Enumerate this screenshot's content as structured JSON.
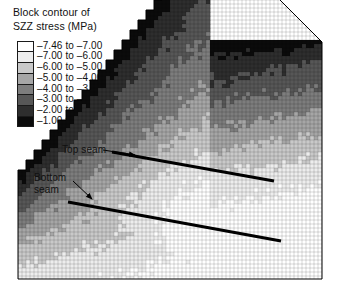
{
  "title": {
    "line1": "Block contour of",
    "line2": "SZZ stress (MPa)"
  },
  "legend": {
    "entries": [
      {
        "label": "–7.46 to –7.00",
        "color": "#ffffff",
        "low": -7.46,
        "high": -7.0
      },
      {
        "label": "–7.00 to –6.00",
        "color": "#ededed",
        "low": -7.0,
        "high": -6.0
      },
      {
        "label": "–6.00 to –5.00",
        "color": "#c9c9c9",
        "low": -6.0,
        "high": -5.0
      },
      {
        "label": "–5.00 to –4.00",
        "color": "#a6a6a6",
        "low": -5.0,
        "high": -4.0
      },
      {
        "label": "–4.00 to –3.00",
        "color": "#7d7d7d",
        "low": -4.0,
        "high": -3.0
      },
      {
        "label": "–3.00 to –2.00",
        "color": "#575757",
        "low": -3.0,
        "high": -2.0
      },
      {
        "label": "–2.00 to –1.00",
        "color": "#2e2e2e",
        "low": -2.0,
        "high": -1.0
      },
      {
        "label": "–1.00 to –0.04",
        "color": "#0b0b0b",
        "low": -1.0,
        "high": -0.04
      }
    ]
  },
  "annotations": [
    {
      "name": "top-seam",
      "text": "Top seam"
    },
    {
      "name": "bottom-seam-line1",
      "text": "Bottom"
    },
    {
      "name": "bottom-seam-line2",
      "text": "seam"
    }
  ],
  "chart_data": {
    "type": "heatmap",
    "title": "Block contour of SZZ stress (MPa)",
    "xlabel": "",
    "ylabel": "",
    "units": "MPa",
    "value_range": [
      -7.46,
      -0.04
    ],
    "grid": true,
    "legend_position": "top-left",
    "colormap": "greyscale-inverted",
    "bands": [
      -7.46,
      -7.0,
      -6.0,
      -5.0,
      -4.0,
      -3.0,
      -2.0,
      -1.0,
      -0.04
    ],
    "mesh": {
      "left": 18,
      "right": 322,
      "bottom": 279,
      "top_flat_y": 42,
      "top_flat_start_x": 210,
      "cell_w": 4.0,
      "cell_h": 4.0,
      "staircase_step_w": 8,
      "staircase_step_h": 10,
      "staircase_start": [
        18,
        170
      ],
      "staircase_end": [
        210,
        42
      ]
    },
    "seams": [
      {
        "name": "top seam",
        "x1": 112,
        "y1": 152,
        "x2": 274,
        "y2": 181,
        "width": 3.2,
        "color": "#000000"
      },
      {
        "name": "bottom seam",
        "x1": 68,
        "y1": 202,
        "x2": 281,
        "y2": 241,
        "width": 3.2,
        "color": "#000000"
      }
    ],
    "arrows": [
      {
        "name": "top seam arrow",
        "x1": 103,
        "y1": 150,
        "x2": 135,
        "y2": 155
      },
      {
        "name": "bottom seam arrow",
        "x1": 73,
        "y1": 181,
        "x2": 92,
        "y2": 199
      }
    ]
  }
}
